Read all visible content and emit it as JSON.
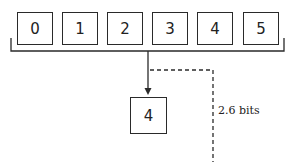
{
  "diagram": {
    "type": "selection-information",
    "input_values": [
      "0",
      "1",
      "2",
      "3",
      "4",
      "5"
    ],
    "output_value": "4",
    "information_label": "2.6 bits",
    "colors": {
      "stroke": "#2a2a2a",
      "background": "#ffffff",
      "text": "#222222"
    }
  }
}
